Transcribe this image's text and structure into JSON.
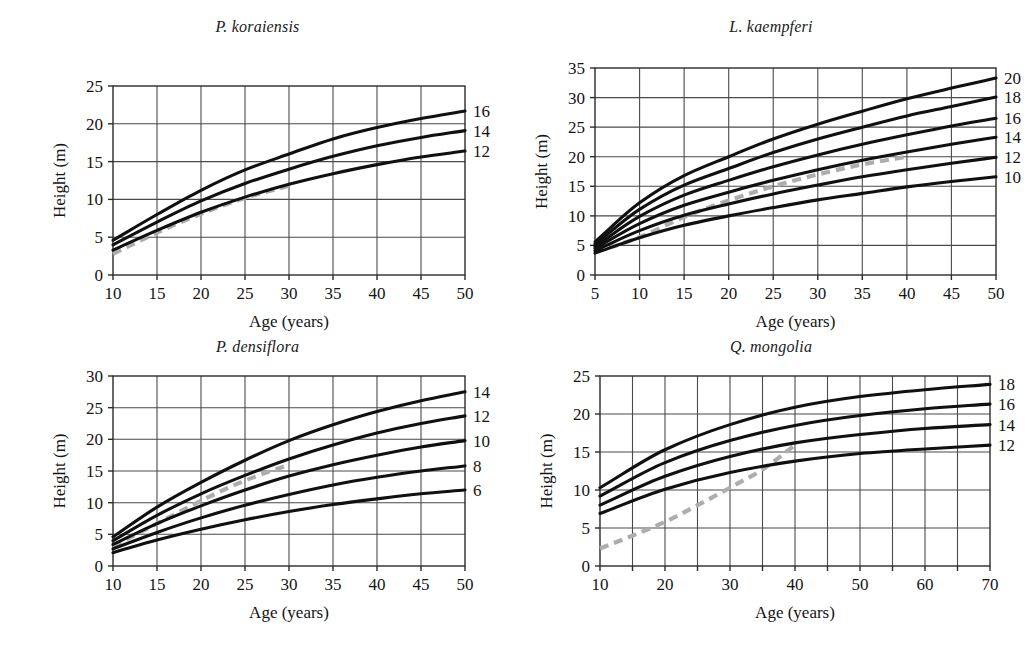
{
  "figure": {
    "panel_count": 4,
    "curve_color": "#101010",
    "guide_color": "#adadad",
    "grid_color": "#4a4a4a"
  },
  "chart_data": [
    {
      "type": "line",
      "panel_id": "p-koraiensis",
      "title": "P. koraiensis",
      "xlabel": "Age (years)",
      "ylabel": "Height (m)",
      "xlim": [
        10,
        50
      ],
      "ylim": [
        0,
        25
      ],
      "xticks": [
        10,
        15,
        20,
        25,
        30,
        35,
        40,
        45,
        50
      ],
      "yticks": [
        0,
        5,
        10,
        15,
        20,
        25
      ],
      "xtick_labels": [
        "10",
        "15",
        "20",
        "25",
        "30",
        "35",
        "40",
        "45",
        "50"
      ],
      "ytick_labels": [
        "0",
        "5",
        "10",
        "15",
        "20",
        "25"
      ],
      "grid": true,
      "legend_position": "right-edge-labels",
      "base_age": 30,
      "series": [
        {
          "name": "16",
          "site_index": 16,
          "x": [
            10,
            15,
            20,
            25,
            30,
            35,
            40,
            45,
            50
          ],
          "values": [
            4.6,
            8.0,
            11.2,
            13.9,
            16.0,
            18.0,
            19.5,
            20.7,
            21.7
          ]
        },
        {
          "name": "14",
          "site_index": 14,
          "x": [
            10,
            15,
            20,
            25,
            30,
            35,
            40,
            45,
            50
          ],
          "values": [
            4.0,
            7.0,
            9.8,
            12.1,
            14.0,
            15.7,
            17.1,
            18.2,
            19.1
          ]
        },
        {
          "name": "12",
          "site_index": 12,
          "x": [
            10,
            15,
            20,
            25,
            30,
            35,
            40,
            45,
            50
          ],
          "values": [
            3.3,
            5.9,
            8.3,
            10.3,
            12.0,
            13.4,
            14.6,
            15.6,
            16.4
          ]
        }
      ],
      "guide": {
        "name": "observed-height-guide",
        "style": "dashed",
        "x": [
          10,
          15,
          20,
          25,
          30
        ],
        "values": [
          2.8,
          5.6,
          8.1,
          10.2,
          11.8
        ]
      },
      "edge_labels": [
        "16",
        "14",
        "12"
      ]
    },
    {
      "type": "line",
      "panel_id": "l-kaempferi",
      "title": "L. kaempferi",
      "xlabel": "Age (years)",
      "ylabel": "Height (m)",
      "xlim": [
        5,
        50
      ],
      "ylim": [
        0,
        35
      ],
      "xticks": [
        5,
        10,
        15,
        20,
        25,
        30,
        35,
        40,
        45,
        50
      ],
      "yticks": [
        0,
        5,
        10,
        15,
        20,
        25,
        30,
        35
      ],
      "xtick_labels": [
        "5",
        "10",
        "15",
        "20",
        "25",
        "30",
        "35",
        "40",
        "45",
        "50"
      ],
      "ytick_labels": [
        "0",
        "5",
        "10",
        "15",
        "20",
        "25",
        "30",
        "35"
      ],
      "grid": true,
      "legend_position": "right-edge-labels",
      "base_age": 20,
      "series": [
        {
          "name": "20",
          "site_index": 20,
          "x": [
            5,
            10,
            15,
            20,
            25,
            30,
            35,
            40,
            45,
            50
          ],
          "values": [
            5.6,
            12.2,
            16.8,
            20.0,
            23.0,
            25.5,
            27.7,
            29.8,
            31.6,
            33.3
          ]
        },
        {
          "name": "18",
          "site_index": 18,
          "x": [
            5,
            10,
            15,
            20,
            25,
            30,
            35,
            40,
            45,
            50
          ],
          "values": [
            5.2,
            11.1,
            15.2,
            18.0,
            20.7,
            23.0,
            25.0,
            26.9,
            28.5,
            30.1
          ]
        },
        {
          "name": "16",
          "site_index": 16,
          "x": [
            5,
            10,
            15,
            20,
            25,
            30,
            35,
            40,
            45,
            50
          ],
          "values": [
            4.8,
            9.9,
            13.5,
            16.0,
            18.3,
            20.3,
            22.1,
            23.7,
            25.2,
            26.5
          ]
        },
        {
          "name": "14",
          "site_index": 14,
          "x": [
            5,
            10,
            15,
            20,
            25,
            30,
            35,
            40,
            45,
            50
          ],
          "values": [
            4.5,
            8.7,
            11.8,
            14.0,
            16.0,
            17.8,
            19.4,
            20.8,
            22.1,
            23.3
          ]
        },
        {
          "name": "12",
          "site_index": 12,
          "x": [
            5,
            10,
            15,
            20,
            25,
            30,
            35,
            40,
            45,
            50
          ],
          "values": [
            4.1,
            7.5,
            10.1,
            12.0,
            13.7,
            15.2,
            16.6,
            17.8,
            18.9,
            19.9
          ]
        },
        {
          "name": "10",
          "site_index": 10,
          "x": [
            5,
            10,
            15,
            20,
            25,
            30,
            35,
            40,
            45,
            50
          ],
          "values": [
            3.7,
            6.3,
            8.4,
            10.0,
            11.4,
            12.7,
            13.8,
            14.9,
            15.8,
            16.6
          ]
        }
      ],
      "guide": {
        "name": "observed-height-guide",
        "style": "dashed",
        "x": [
          5,
          10,
          15,
          20,
          25,
          30,
          35,
          40
        ],
        "values": [
          3.8,
          6.4,
          9.8,
          12.6,
          15.0,
          17.0,
          18.7,
          20.0
        ]
      },
      "edge_labels": [
        "20",
        "18",
        "16",
        "14",
        "12",
        "10"
      ]
    },
    {
      "type": "line",
      "panel_id": "p-densiflora",
      "title": "P. densiflora",
      "xlabel": "Age (years)",
      "ylabel": "Height (m)",
      "xlim": [
        10,
        50
      ],
      "ylim": [
        0,
        30
      ],
      "xticks": [
        10,
        15,
        20,
        25,
        30,
        35,
        40,
        45,
        50
      ],
      "yticks": [
        0,
        5,
        10,
        15,
        20,
        25,
        30
      ],
      "xtick_labels": [
        "10",
        "15",
        "20",
        "25",
        "30",
        "35",
        "40",
        "45",
        "50"
      ],
      "ytick_labels": [
        "0",
        "5",
        "10",
        "15",
        "20",
        "25",
        "30"
      ],
      "grid": true,
      "legend_position": "right-edge-labels",
      "base_age": 20,
      "series": [
        {
          "name": "14",
          "site_index": 14,
          "x": [
            10,
            15,
            20,
            25,
            30,
            35,
            40,
            45,
            50
          ],
          "values": [
            4.6,
            9.3,
            13.2,
            16.7,
            19.8,
            22.3,
            24.4,
            26.1,
            27.5
          ]
        },
        {
          "name": "12",
          "site_index": 12,
          "x": [
            10,
            15,
            20,
            25,
            30,
            35,
            40,
            45,
            50
          ],
          "values": [
            4.0,
            8.0,
            11.4,
            14.3,
            16.9,
            19.1,
            21.0,
            22.5,
            23.7
          ]
        },
        {
          "name": "10",
          "site_index": 10,
          "x": [
            10,
            15,
            20,
            25,
            30,
            35,
            40,
            45,
            50
          ],
          "values": [
            3.4,
            6.7,
            9.5,
            12.0,
            14.2,
            16.0,
            17.5,
            18.8,
            19.8
          ]
        },
        {
          "name": "8",
          "site_index": 8,
          "x": [
            10,
            15,
            20,
            25,
            30,
            35,
            40,
            45,
            50
          ],
          "values": [
            2.7,
            5.3,
            7.6,
            9.6,
            11.3,
            12.8,
            14.0,
            15.0,
            15.8
          ]
        },
        {
          "name": "6",
          "site_index": 6,
          "x": [
            10,
            15,
            20,
            25,
            30,
            35,
            40,
            45,
            50
          ],
          "values": [
            2.1,
            4.1,
            5.8,
            7.3,
            8.6,
            9.7,
            10.6,
            11.4,
            12.0
          ]
        }
      ],
      "guide": {
        "name": "observed-height-guide",
        "style": "dashed",
        "x": [
          10,
          15,
          20,
          25,
          30
        ],
        "values": [
          3.1,
          6.7,
          10.3,
          13.5,
          16.0
        ]
      },
      "edge_labels": [
        "14",
        "12",
        "10",
        "8",
        "6"
      ]
    },
    {
      "type": "line",
      "panel_id": "q-mongolia",
      "title": "Q. mongolia",
      "xlabel": "Age (years)",
      "ylabel": "Height (m)",
      "xlim": [
        10,
        70
      ],
      "ylim": [
        0,
        25
      ],
      "xticks": [
        10,
        15,
        20,
        25,
        30,
        35,
        40,
        45,
        50,
        55,
        60,
        65,
        70
      ],
      "yticks": [
        0,
        5,
        10,
        15,
        20,
        25
      ],
      "xtick_labels": [
        "10",
        "",
        "20",
        "",
        "30",
        "",
        "40",
        "",
        "50",
        "",
        "60",
        "",
        "70"
      ],
      "ytick_labels": [
        "0",
        "5",
        "10",
        "15",
        "20",
        "25"
      ],
      "grid": true,
      "legend_position": "right-edge-labels",
      "base_age": 30,
      "series": [
        {
          "name": "18",
          "site_index": 18,
          "x": [
            10,
            20,
            30,
            40,
            50,
            60,
            70
          ],
          "values": [
            10.3,
            15.3,
            18.6,
            20.9,
            22.3,
            23.2,
            23.9
          ]
        },
        {
          "name": "16",
          "site_index": 16,
          "x": [
            10,
            20,
            30,
            40,
            50,
            60,
            70
          ],
          "values": [
            9.2,
            13.6,
            16.5,
            18.5,
            19.8,
            20.7,
            21.3
          ]
        },
        {
          "name": "14",
          "site_index": 14,
          "x": [
            10,
            20,
            30,
            40,
            50,
            60,
            70
          ],
          "values": [
            8.0,
            11.8,
            14.4,
            16.2,
            17.3,
            18.1,
            18.6
          ]
        },
        {
          "name": "12",
          "site_index": 12,
          "x": [
            10,
            20,
            30,
            40,
            50,
            60,
            70
          ],
          "values": [
            6.9,
            10.1,
            12.3,
            13.8,
            14.8,
            15.4,
            15.9
          ]
        }
      ],
      "guide": {
        "name": "observed-height-guide",
        "style": "dashed",
        "x": [
          10,
          15,
          20,
          25,
          30,
          35,
          40
        ],
        "values": [
          2.3,
          4.0,
          5.8,
          8.0,
          10.3,
          12.7,
          15.9
        ]
      },
      "edge_labels": [
        "18",
        "16",
        "14",
        "12"
      ]
    }
  ]
}
